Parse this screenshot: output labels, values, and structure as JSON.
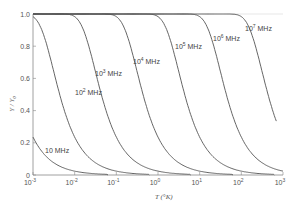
{
  "chart_data": {
    "type": "line",
    "title": "",
    "xlabel": "T (°K)",
    "ylabel": "Y / Y0",
    "xscale": "log",
    "xlim": [
      0.001,
      1000
    ],
    "ylim": [
      0,
      1.0
    ],
    "grid": false,
    "legend": "inline labels on curves",
    "x_ticks": [
      {
        "base": "10",
        "exp": "-3"
      },
      {
        "base": "10",
        "exp": "-2"
      },
      {
        "base": "10",
        "exp": "-1"
      },
      {
        "base": "10",
        "exp": "0"
      },
      {
        "base": "10",
        "exp": "1"
      },
      {
        "base": "10",
        "exp": "2"
      },
      {
        "base": "10",
        "exp": "3"
      }
    ],
    "y_ticks": [
      "0",
      "0.2",
      "0.4",
      "0.6",
      "0.8",
      "1.0"
    ],
    "x": [
      0.001,
      0.002,
      0.005,
      0.01,
      0.02,
      0.05,
      0.1,
      0.2,
      0.5,
      1,
      2,
      5,
      10,
      20,
      50,
      100,
      200,
      500,
      1000
    ],
    "series": [
      {
        "name": "10 MHz",
        "freq_mhz": 10,
        "values": [
          0.235,
          0.119,
          0.048,
          0.024,
          0.012,
          0.005,
          0.002,
          0.001,
          0.0,
          0.0,
          0.0,
          0.0,
          0.0,
          0.0,
          0.0,
          0.0,
          0.0,
          0.0,
          0.0
        ]
      },
      {
        "name": "10^2 MHz",
        "freq_mhz": 100,
        "values": [
          0.984,
          0.834,
          0.446,
          0.235,
          0.119,
          0.048,
          0.024,
          0.012,
          0.005,
          0.002,
          0.001,
          0.0,
          0.0,
          0.0,
          0.0,
          0.0,
          0.0,
          0.0,
          0.0
        ]
      },
      {
        "name": "10^3 MHz",
        "freq_mhz": 1000,
        "values": [
          1.0,
          1.0,
          1.0,
          0.984,
          0.834,
          0.446,
          0.235,
          0.119,
          0.048,
          0.024,
          0.012,
          0.005,
          0.002,
          0.001,
          0.0,
          0.0,
          0.0,
          0.0,
          0.0
        ]
      },
      {
        "name": "10^4 MHz",
        "freq_mhz": 10000,
        "values": [
          1.0,
          1.0,
          1.0,
          1.0,
          1.0,
          1.0,
          0.984,
          0.834,
          0.446,
          0.235,
          0.119,
          0.048,
          0.024,
          0.012,
          0.005,
          0.002,
          0.001,
          0.0,
          0.0
        ]
      },
      {
        "name": "10^5 MHz",
        "freq_mhz": 100000,
        "values": [
          1.0,
          1.0,
          1.0,
          1.0,
          1.0,
          1.0,
          1.0,
          1.0,
          1.0,
          0.984,
          0.834,
          0.446,
          0.235,
          0.119,
          0.048,
          0.024,
          0.012,
          0.005,
          0.002
        ]
      },
      {
        "name": "10^6 MHz",
        "freq_mhz": 1000000,
        "values": [
          1.0,
          1.0,
          1.0,
          1.0,
          1.0,
          1.0,
          1.0,
          1.0,
          1.0,
          1.0,
          1.0,
          1.0,
          0.984,
          0.834,
          0.446,
          0.235,
          0.119,
          0.048,
          0.024
        ]
      },
      {
        "name": "10^7 MHz",
        "freq_mhz": 10000000,
        "values": [
          1.0,
          1.0,
          1.0,
          1.0,
          1.0,
          1.0,
          1.0,
          1.0,
          1.0,
          1.0,
          1.0,
          1.0,
          1.0,
          1.0,
          1.0,
          0.984,
          0.834,
          0.446,
          0.27
        ]
      }
    ],
    "curve_labels": [
      {
        "base": "10",
        "exp": "",
        "unit": "MHz"
      },
      {
        "base": "10",
        "exp": "2",
        "unit": "MHz"
      },
      {
        "base": "10",
        "exp": "3",
        "unit": "MHz"
      },
      {
        "base": "10",
        "exp": "4",
        "unit": "MHz"
      },
      {
        "base": "10",
        "exp": "5",
        "unit": "MHz"
      },
      {
        "base": "10",
        "exp": "6",
        "unit": "MHz"
      },
      {
        "base": "10",
        "exp": "7",
        "unit": "MHz"
      }
    ]
  },
  "axes": {
    "x_label_main": "T",
    "x_label_unit": "(°K)",
    "y_label": "Y / Y",
    "y_label_sub": "0"
  },
  "colors": {
    "curve": "#555555",
    "axis": "#888888",
    "background": "#ffffff"
  }
}
